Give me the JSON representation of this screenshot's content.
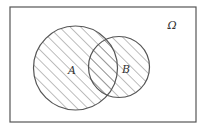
{
  "diagram": {
    "type": "venn",
    "universe": {
      "label": "Ω",
      "rect": {
        "x": 10,
        "y": 7,
        "width": 186,
        "height": 115
      },
      "label_pos": {
        "x": 172,
        "y": 29
      }
    },
    "sets": [
      {
        "name": "A",
        "label": "A",
        "cx": 75.5,
        "cy": 68,
        "r": 42,
        "label_pos": {
          "x": 72,
          "y": 74
        }
      },
      {
        "name": "B",
        "label": "B",
        "cx": 119,
        "cy": 67,
        "r": 30.5,
        "label_pos": {
          "x": 126,
          "y": 73
        }
      }
    ],
    "shaded_region": "A ∪ B",
    "shading": {
      "style": "diagonal-hatch",
      "angle_deg": 45,
      "spacing_px": 7.5,
      "color": "#7a7a7a"
    },
    "colors": {
      "outline": "#555555",
      "background": "#ffffff",
      "text": "#333333"
    }
  }
}
